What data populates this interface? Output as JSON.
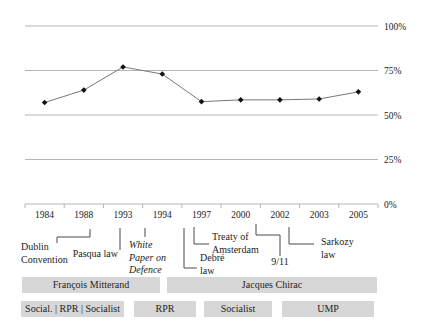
{
  "chart_data": {
    "type": "line",
    "x": [
      "1984",
      "1988",
      "1993",
      "1994",
      "1997",
      "2000",
      "2002",
      "2003",
      "2005"
    ],
    "values": [
      57,
      64,
      77,
      73,
      57.5,
      58.5,
      58.5,
      59,
      63
    ],
    "ylim": [
      0,
      100
    ],
    "yticks": [
      {
        "value": 100,
        "label": "100%"
      },
      {
        "value": 75,
        "label": "75%"
      },
      {
        "value": 50,
        "label": "50%"
      },
      {
        "value": 25,
        "label": "25%"
      },
      {
        "value": 0,
        "label": "0%"
      }
    ],
    "title": "",
    "xlabel": "",
    "ylabel": "",
    "grid": "horizontal",
    "legend": "none",
    "marker": "diamond"
  },
  "annotations": {
    "dublin": "Dublin\nConvention",
    "pasqua": "Pasqua law",
    "white_paper": "White\nPaper on\nDefence",
    "debre": "Debré\nlaw",
    "treaty": "Treaty of\nAmsterdam",
    "nine_eleven": "9/11",
    "sarkozy": "Sarkozy\nlaw"
  },
  "presidents": [
    {
      "name": "François Mitterand"
    },
    {
      "name": "Jacques Chirac"
    }
  ],
  "parties": [
    {
      "label": "Social. | RPR | Socialist"
    },
    {
      "label": "RPR"
    },
    {
      "label": "Socialist"
    },
    {
      "label": "UMP"
    }
  ],
  "colors": {
    "gridline": "#b5b5b5",
    "line": "#787878",
    "marker": "#111111",
    "bar_fill": "#d7d7d7",
    "text": "#1c1c1c"
  }
}
